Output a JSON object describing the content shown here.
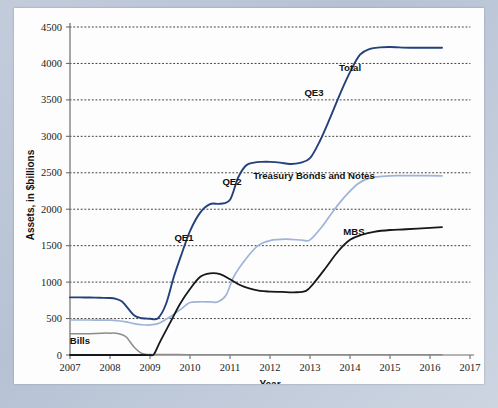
{
  "chart_data": {
    "type": "line",
    "title": "",
    "xlabel": "Year",
    "ylabel": "Assets, in $billions",
    "xlim": [
      2007,
      2017
    ],
    "ylim": [
      0,
      4500
    ],
    "grid": true,
    "legend": "inline-annotations",
    "xticks": [
      "2007",
      "2008",
      "2009",
      "2010",
      "2011",
      "2012",
      "2013",
      "2014",
      "2015",
      "2016",
      "2017"
    ],
    "yticks": [
      "0",
      "500",
      "1000",
      "1500",
      "2000",
      "2500",
      "3000",
      "3500",
      "4000",
      "4500"
    ],
    "annotations": [
      {
        "text": "QE1",
        "x": 2009.85,
        "y": 1560
      },
      {
        "text": "QE2",
        "x": 2011.05,
        "y": 2330
      },
      {
        "text": "QE3",
        "x": 2013.1,
        "y": 3560
      },
      {
        "text": "Total",
        "x": 2014.0,
        "y": 3900
      },
      {
        "text": "Treasury Bonds and Notes",
        "x": 2013.1,
        "y": 2420
      },
      {
        "text": "MBS",
        "x": 2014.1,
        "y": 1640
      },
      {
        "text": "Bills",
        "x": 2007.25,
        "y": 150
      }
    ],
    "series": [
      {
        "name": "Total",
        "color": "#24417c",
        "x": [
          2007.0,
          2007.25,
          2007.5,
          2007.75,
          2008.0,
          2008.15,
          2008.3,
          2008.45,
          2008.6,
          2008.75,
          2008.9,
          2009.0,
          2009.2,
          2009.4,
          2009.6,
          2009.8,
          2010.0,
          2010.25,
          2010.5,
          2010.75,
          2011.0,
          2011.2,
          2011.4,
          2011.6,
          2011.8,
          2012.0,
          2012.25,
          2012.5,
          2012.75,
          2013.0,
          2013.25,
          2013.5,
          2013.75,
          2014.0,
          2014.25,
          2014.5,
          2014.75,
          2015.0,
          2015.5,
          2016.0,
          2016.3
        ],
        "y": [
          790,
          790,
          788,
          785,
          782,
          770,
          735,
          640,
          545,
          510,
          500,
          498,
          505,
          700,
          1080,
          1400,
          1700,
          1950,
          2070,
          2075,
          2130,
          2430,
          2600,
          2640,
          2650,
          2650,
          2640,
          2620,
          2635,
          2700,
          2940,
          3250,
          3580,
          3880,
          4120,
          4200,
          4220,
          4225,
          4215,
          4215,
          4215
        ]
      },
      {
        "name": "Treasury Bonds and Notes",
        "color": "#9fb4d8",
        "x": [
          2007.0,
          2007.5,
          2008.0,
          2008.2,
          2008.4,
          2008.6,
          2008.8,
          2009.0,
          2009.2,
          2009.4,
          2009.6,
          2009.8,
          2010.0,
          2010.25,
          2010.5,
          2010.7,
          2010.9,
          2011.1,
          2011.4,
          2011.7,
          2012.0,
          2012.4,
          2012.8,
          2013.0,
          2013.3,
          2013.6,
          2013.9,
          2014.2,
          2014.5,
          2014.8,
          2015.2,
          2015.8,
          2016.3
        ],
        "y": [
          480,
          480,
          478,
          470,
          455,
          430,
          415,
          412,
          430,
          490,
          560,
          640,
          720,
          730,
          728,
          730,
          820,
          1080,
          1320,
          1500,
          1570,
          1590,
          1575,
          1580,
          1760,
          1990,
          2190,
          2350,
          2430,
          2450,
          2460,
          2460,
          2458
        ]
      },
      {
        "name": "MBS",
        "color": "#15181c",
        "x": [
          2007.0,
          2008.0,
          2008.6,
          2008.9,
          2009.0,
          2009.1,
          2009.25,
          2009.5,
          2009.75,
          2010.0,
          2010.25,
          2010.5,
          2010.75,
          2011.0,
          2011.25,
          2011.5,
          2011.75,
          2012.0,
          2012.3,
          2012.6,
          2012.9,
          2013.1,
          2013.4,
          2013.7,
          2014.0,
          2014.3,
          2014.6,
          2015.0,
          2015.4,
          2016.0,
          2016.3
        ],
        "y": [
          0,
          0,
          0,
          0,
          0,
          10,
          180,
          440,
          700,
          905,
          1070,
          1120,
          1110,
          1040,
          960,
          910,
          880,
          870,
          865,
          860,
          880,
          990,
          1200,
          1420,
          1580,
          1650,
          1690,
          1715,
          1725,
          1745,
          1755
        ]
      },
      {
        "name": "Bills",
        "color": "#8c8c8c",
        "x": [
          2007.0,
          2007.4,
          2007.8,
          2008.0,
          2008.2,
          2008.4,
          2008.6,
          2008.8,
          2009.0,
          2009.5,
          2010.0,
          2011.0,
          2012.0,
          2012.6,
          2013.0,
          2014.0,
          2015.0,
          2016.0,
          2016.3
        ],
        "y": [
          290,
          292,
          300,
          300,
          295,
          250,
          110,
          20,
          8,
          6,
          5,
          5,
          4,
          3,
          2,
          2,
          2,
          2,
          2
        ]
      }
    ]
  },
  "axis": {
    "y_title": "Assets, in $billions",
    "x_title": "Year"
  }
}
